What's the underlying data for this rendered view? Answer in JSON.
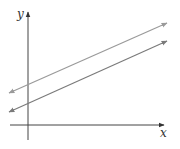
{
  "diagram": {
    "axes": {
      "x_label": "x",
      "y_label": "y",
      "color": "#444444"
    },
    "lines": [
      {
        "name": "upper-line",
        "color": "#9a9a9a",
        "x1": 9,
        "y1": 93,
        "x2": 167,
        "y2": 23
      },
      {
        "name": "lower-line",
        "color": "#7a7a7a",
        "x1": 9,
        "y1": 112,
        "x2": 167,
        "y2": 41
      }
    ]
  }
}
